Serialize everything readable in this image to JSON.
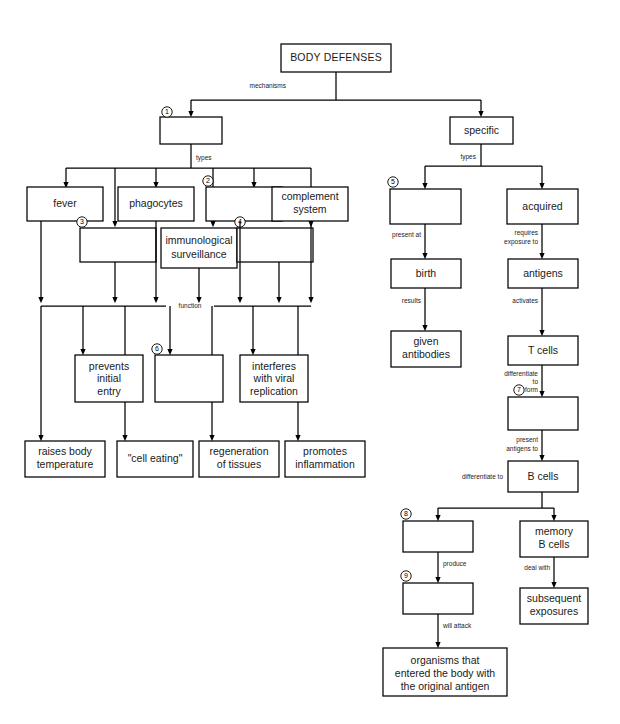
{
  "document": {
    "title": "BODY DEFENSES",
    "type": "concept-map-worksheet",
    "ink_color": "#000000",
    "paper_color": "#ffffff"
  },
  "nodes": {
    "root": {
      "label": "BODY DEFENSES"
    },
    "nonspecific_blank": {
      "label": "",
      "number": "1"
    },
    "specific": {
      "label": "specific"
    },
    "fever": {
      "label": "fever"
    },
    "phagocytes": {
      "label": "phagocytes"
    },
    "blank2": {
      "label": "",
      "number": "2"
    },
    "complement_system": {
      "label": "complement\nsystem",
      "line1": "complement",
      "line2": "system"
    },
    "blank3": {
      "label": "",
      "number": "3"
    },
    "immunological_surveillance": {
      "label": "immunological surveillance",
      "line1": "immunological",
      "line2": "surveillance"
    },
    "blank4": {
      "label": "",
      "number": "4"
    },
    "prevents_initial_entry": {
      "line1": "prevents",
      "line2": "initial",
      "line3": "entry"
    },
    "blank6": {
      "label": "",
      "number": "6"
    },
    "interferes_viral": {
      "line1": "interferes",
      "line2": "with viral",
      "line3": "replication"
    },
    "raises_body_temperature": {
      "line1": "raises body",
      "line2": "temperature"
    },
    "cell_eating": {
      "label": "\"cell eating\""
    },
    "regeneration_of_tissues": {
      "line1": "regeneration",
      "line2": "of tissues"
    },
    "promotes_inflammation": {
      "line1": "promotes",
      "line2": "inflammation"
    },
    "blank5": {
      "label": "",
      "number": "5"
    },
    "acquired": {
      "label": "acquired"
    },
    "birth": {
      "label": "birth"
    },
    "antigens": {
      "label": "antigens"
    },
    "given_antibodies": {
      "line1": "given",
      "line2": "antibodies"
    },
    "t_cells": {
      "label": "T cells"
    },
    "blank7": {
      "label": "",
      "number": "7"
    },
    "b_cells": {
      "label": "B cells"
    },
    "blank8": {
      "label": "",
      "number": "8"
    },
    "memory_b_cells": {
      "line1": "memory",
      "line2": "B cells"
    },
    "blank9": {
      "label": "",
      "number": "9"
    },
    "subsequent_exposures": {
      "line1": "subsequent",
      "line2": "exposures"
    },
    "organisms_entered": {
      "line1": "organisms that",
      "line2": "entered the body with",
      "line3": "the original antigen"
    }
  },
  "edge_labels": {
    "mechanisms": "mechanisms",
    "types_left": "types",
    "types_right": "types",
    "function": "function",
    "present_at": "present at",
    "results": "results",
    "requires_exposure_to_1": "requires",
    "requires_exposure_to_2": "exposure to",
    "activates": "activates",
    "differentiate_to_form_1": "differentiate",
    "differentiate_to_form_2": "to",
    "differentiate_to_form_3": "form",
    "present_antigens_to_1": "present",
    "present_antigens_to_2": "antigens to",
    "differentiate_to": "differentiate to",
    "produce": "produce",
    "will_attack": "will attack",
    "deal_with": "deal with"
  },
  "numbers": {
    "n1": "1",
    "n2": "2",
    "n3": "3",
    "n4": "4",
    "n5": "5",
    "n6": "6",
    "n7": "7",
    "n8": "8",
    "n9": "9"
  },
  "blanks_count": 9
}
